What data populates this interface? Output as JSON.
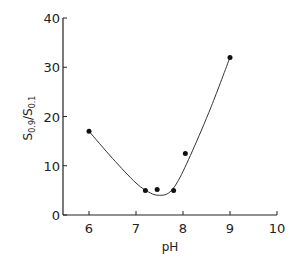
{
  "chart_data": {
    "type": "scatter",
    "title": "",
    "xlabel": "pH",
    "ylabel": "S0.9/S0.1",
    "ylabel_main": "S",
    "ylabel_sub1": "0.9",
    "ylabel_slash": "/",
    "ylabel_sub2": "0.1",
    "xlim": [
      5.5,
      10
    ],
    "ylim": [
      0,
      40
    ],
    "xticks": [
      6,
      7,
      8,
      9,
      10
    ],
    "yticks": [
      0,
      10,
      20,
      30,
      40
    ],
    "grid": false,
    "legend": null,
    "series": [
      {
        "name": "measured",
        "x": [
          6,
          7.2,
          7.45,
          7.8,
          8.05,
          9
        ],
        "y": [
          17,
          5,
          5.2,
          5,
          12.5,
          32
        ]
      }
    ],
    "fitted_curve": {
      "description": "smooth hand-drawn fit through points, minimum ~4 near pH 7.5",
      "x": [
        6,
        6.5,
        7,
        7.3,
        7.5,
        7.7,
        7.9,
        8.2,
        8.6,
        9
      ],
      "y": [
        17,
        11.5,
        6.5,
        4.5,
        4.0,
        4.5,
        7,
        13,
        22,
        32
      ]
    }
  }
}
